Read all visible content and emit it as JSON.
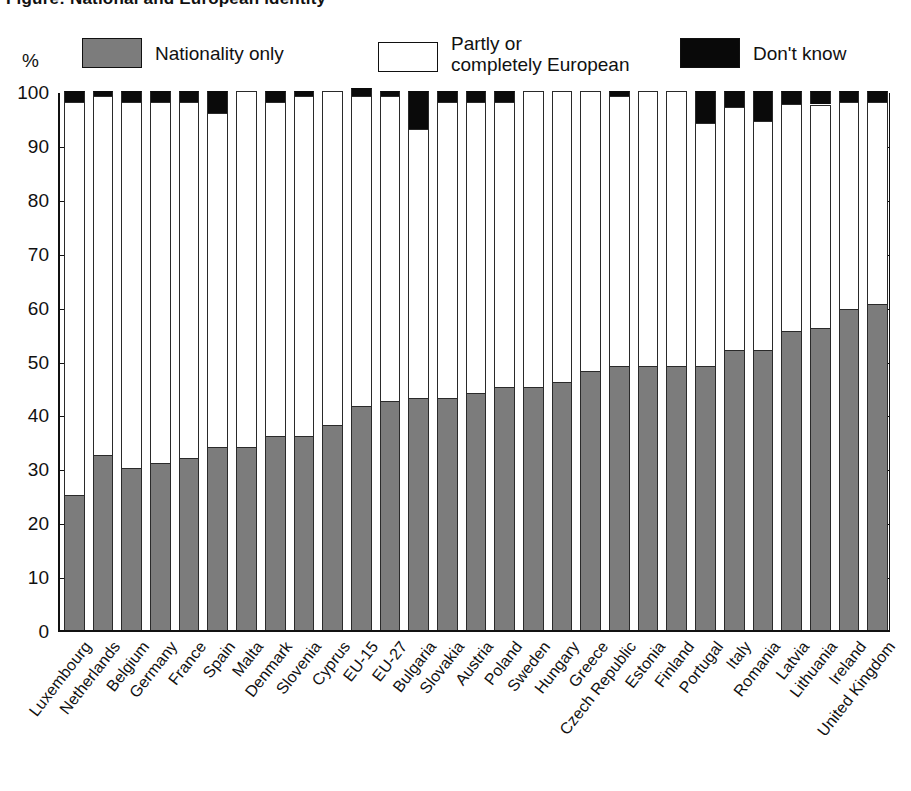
{
  "title": "Figure: National and European identity",
  "axis": {
    "ylabel": "%",
    "yticks": [
      "0",
      "10",
      "20",
      "30",
      "40",
      "50",
      "60",
      "70",
      "80",
      "90",
      "100"
    ]
  },
  "legend": {
    "items": [
      {
        "key": "nationality",
        "label": "Nationality only",
        "color": "#7c7c7c"
      },
      {
        "key": "european",
        "label": "Partly or\ncompletely European",
        "color": "#ffffff"
      },
      {
        "key": "dontknow",
        "label": "Don't know",
        "color": "#0a0a0a"
      }
    ]
  },
  "chart_data": {
    "type": "bar",
    "title": "National and European identity",
    "xlabel": "",
    "ylabel": "%",
    "ylim": [
      0,
      100
    ],
    "grid": false,
    "stacked": true,
    "legend_position": "top",
    "categories": [
      "Luxembourg",
      "Netherlands",
      "Belgium",
      "Germany",
      "France",
      "Spain",
      "Malta",
      "Denmark",
      "Slovenia",
      "Cyprus",
      "EU-15",
      "EU-27",
      "Bulgaria",
      "Slovakia",
      "Austria",
      "Poland",
      "Sweden",
      "Hungary",
      "Greece",
      "Czech Republic",
      "Estonia",
      "Finland",
      "Portugal",
      "Italy",
      "Romania",
      "Latvia",
      "Lithuania",
      "Ireland",
      "United Kingdom"
    ],
    "series": [
      {
        "name": "Nationality only",
        "color": "#7c7c7c",
        "values": [
          25,
          32.5,
          30,
          31,
          32,
          34,
          34,
          36,
          36,
          38,
          41.5,
          42.5,
          43,
          43,
          44,
          45,
          45,
          46,
          48,
          49,
          49,
          49,
          49,
          52,
          52,
          55.5,
          56,
          59.5,
          60.5
        ]
      },
      {
        "name": "Partly or completely European",
        "color": "#ffffff",
        "values": [
          73,
          66.5,
          68,
          67,
          66,
          62,
          66,
          62,
          63,
          62,
          57.5,
          56.5,
          50,
          55,
          54,
          53,
          55,
          54,
          52,
          50,
          51,
          51,
          45,
          45,
          42.5,
          42,
          41.5,
          38.5,
          37.5
        ]
      },
      {
        "name": "Don't know",
        "color": "#0a0a0a",
        "values": [
          2,
          1,
          2,
          2,
          2,
          4,
          0,
          2,
          1,
          0,
          1.5,
          1,
          7,
          2,
          2,
          2,
          0,
          0,
          0,
          1,
          0,
          0,
          6,
          3,
          5.5,
          2.5,
          2.5,
          2,
          2
        ]
      }
    ]
  }
}
